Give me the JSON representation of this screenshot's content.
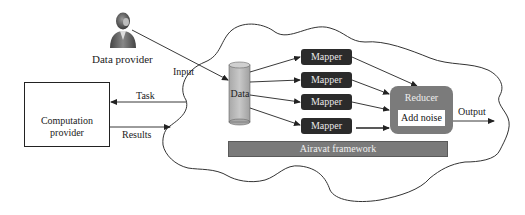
{
  "diagram": {
    "actors": {
      "data_provider": {
        "label": "Data provider",
        "icon": "person-icon"
      },
      "computation_provider": {
        "label_line1": "Computation",
        "label_line2": "provider",
        "icons": [
          "smartphone-icon",
          "laptop-icon"
        ]
      }
    },
    "edges": {
      "input": "Input",
      "task": "Task",
      "results": "Results",
      "output": "Output"
    },
    "cloud": {
      "data_store": {
        "label": "Data",
        "icon": "database-cylinder-icon"
      },
      "mappers": [
        {
          "label": "Mapper"
        },
        {
          "label": "Mapper"
        },
        {
          "label": "Mapper"
        },
        {
          "label": "Mapper"
        }
      ],
      "reducer": {
        "label": "Reducer",
        "inner_label": "Add noise"
      },
      "framework": {
        "label": "Airavat framework"
      }
    },
    "colors": {
      "mapper_fill": "#2b2b2b",
      "reducer_fill": "#7b7b7b",
      "framework_fill": "#7a7a7a",
      "cylinder_fill": "#b9b9b9",
      "line": "#222222"
    }
  }
}
